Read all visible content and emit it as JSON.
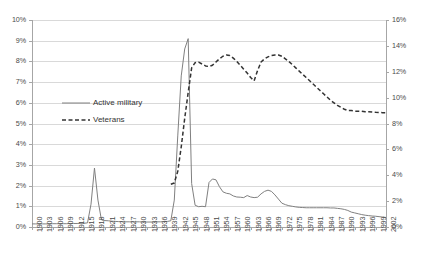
{
  "chart_data": {
    "type": "line",
    "title": "",
    "xlabel": "",
    "ylabel": "",
    "grid": true,
    "legend_position": "inside-upper-left",
    "x_axis": {
      "min": 1900,
      "max": 2002,
      "tick_step": 3,
      "tick_labels": [
        "1900",
        "1903",
        "1906",
        "1909",
        "1912",
        "1915",
        "1918",
        "1921",
        "1924",
        "1927",
        "1930",
        "1933",
        "1936",
        "1939",
        "1942",
        "1945",
        "1948",
        "1951",
        "1954",
        "1957",
        "1960",
        "1963",
        "1966",
        "1969",
        "1972",
        "1975",
        "1978",
        "1981",
        "1984",
        "1987",
        "1990",
        "1993",
        "1996",
        "1999",
        "2002"
      ]
    },
    "y_axis_left": {
      "min": 0,
      "max": 10,
      "unit": "%",
      "tick_step": 1,
      "tick_labels": [
        "10%",
        "9%",
        "8%",
        "7%",
        "6%",
        "5%",
        "4%",
        "3%",
        "2%",
        "1%",
        "0%"
      ]
    },
    "y_axis_right": {
      "min": 0,
      "max": 16,
      "unit": "%",
      "tick_step": 2,
      "tick_labels": [
        "16%",
        "14%",
        "12%",
        "10%",
        "8%",
        "6%",
        "4%",
        "2%",
        "0%"
      ]
    },
    "series": [
      {
        "name": "Active military",
        "axis": "left",
        "style": "solid",
        "color": "#808080",
        "x": [
          1900,
          1901,
          1902,
          1903,
          1904,
          1905,
          1906,
          1907,
          1908,
          1909,
          1910,
          1911,
          1912,
          1913,
          1914,
          1915,
          1916,
          1917,
          1918,
          1919,
          1920,
          1921,
          1922,
          1923,
          1924,
          1925,
          1926,
          1927,
          1928,
          1929,
          1930,
          1931,
          1932,
          1933,
          1934,
          1935,
          1936,
          1937,
          1938,
          1939,
          1940,
          1941,
          1942,
          1943,
          1944,
          1945,
          1946,
          1947,
          1948,
          1949,
          1950,
          1951,
          1952,
          1953,
          1954,
          1955,
          1956,
          1957,
          1958,
          1959,
          1960,
          1961,
          1962,
          1963,
          1964,
          1965,
          1966,
          1967,
          1968,
          1969,
          1970,
          1971,
          1972,
          1973,
          1974,
          1975,
          1976,
          1977,
          1978,
          1979,
          1980,
          1981,
          1982,
          1983,
          1984,
          1985,
          1986,
          1987,
          1988,
          1989,
          1990,
          1991,
          1992,
          1993,
          1994,
          1995,
          1996,
          1997,
          1998,
          1999,
          2000,
          2001,
          2002
        ],
        "values": [
          0.15,
          0.15,
          0.15,
          0.15,
          0.15,
          0.15,
          0.16,
          0.16,
          0.16,
          0.16,
          0.16,
          0.17,
          0.17,
          0.17,
          0.18,
          0.18,
          0.2,
          1.1,
          2.85,
          1.3,
          0.35,
          0.31,
          0.3,
          0.28,
          0.27,
          0.26,
          0.26,
          0.25,
          0.25,
          0.25,
          0.25,
          0.25,
          0.24,
          0.24,
          0.24,
          0.24,
          0.25,
          0.25,
          0.26,
          0.27,
          0.3,
          1.3,
          4.4,
          7.3,
          8.6,
          9.1,
          2.1,
          1.05,
          0.98,
          1.0,
          0.98,
          2.15,
          2.32,
          2.28,
          1.95,
          1.7,
          1.63,
          1.6,
          1.5,
          1.45,
          1.44,
          1.42,
          1.52,
          1.45,
          1.42,
          1.44,
          1.6,
          1.72,
          1.78,
          1.72,
          1.55,
          1.35,
          1.15,
          1.08,
          1.03,
          1.0,
          0.97,
          0.95,
          0.94,
          0.93,
          0.93,
          0.93,
          0.93,
          0.93,
          0.93,
          0.93,
          0.92,
          0.92,
          0.9,
          0.88,
          0.85,
          0.8,
          0.72,
          0.68,
          0.64,
          0.6,
          0.57,
          0.55,
          0.53,
          0.52,
          0.5,
          0.48,
          0.46
        ]
      },
      {
        "name": "Veterans",
        "axis": "right",
        "style": "dashed",
        "color": "#333333",
        "x": [
          1940,
          1941,
          1942,
          1943,
          1944,
          1945,
          1946,
          1947,
          1948,
          1949,
          1950,
          1951,
          1952,
          1953,
          1954,
          1955,
          1956,
          1957,
          1958,
          1959,
          1960,
          1961,
          1962,
          1963,
          1964,
          1965,
          1966,
          1967,
          1968,
          1969,
          1970,
          1971,
          1972,
          1973,
          1974,
          1975,
          1976,
          1977,
          1978,
          1979,
          1980,
          1981,
          1982,
          1983,
          1984,
          1985,
          1986,
          1987,
          1988,
          1989,
          1990,
          1991,
          1992,
          1993,
          1994,
          1995,
          1996,
          1997,
          1998,
          1999,
          2000,
          2001,
          2002
        ],
        "values": [
          3.3,
          3.4,
          4.3,
          6.2,
          8.4,
          10.4,
          12.3,
          12.7,
          12.75,
          12.6,
          12.45,
          12.4,
          12.5,
          12.75,
          13.0,
          13.2,
          13.3,
          13.25,
          13.05,
          12.8,
          12.5,
          12.2,
          11.9,
          11.55,
          11.3,
          12.1,
          12.75,
          13.0,
          13.15,
          13.25,
          13.3,
          13.3,
          13.2,
          13.0,
          12.8,
          12.55,
          12.3,
          12.05,
          11.8,
          11.55,
          11.3,
          11.05,
          10.8,
          10.55,
          10.3,
          10.05,
          9.8,
          9.6,
          9.4,
          9.25,
          9.1,
          9.0,
          9.0,
          8.95,
          8.95,
          8.95,
          8.9,
          8.9,
          8.88,
          8.86,
          8.85,
          8.84,
          8.83
        ]
      }
    ],
    "legend": [
      {
        "label": "Active military",
        "style": "solid"
      },
      {
        "label": "Veterans",
        "style": "dashed"
      }
    ]
  },
  "colors": {
    "grid": "#d9d9d9",
    "axis": "#a6a6a6",
    "text": "#4a4a4a",
    "active_military": "#808080",
    "veterans": "#333333",
    "background": "#ffffff"
  }
}
